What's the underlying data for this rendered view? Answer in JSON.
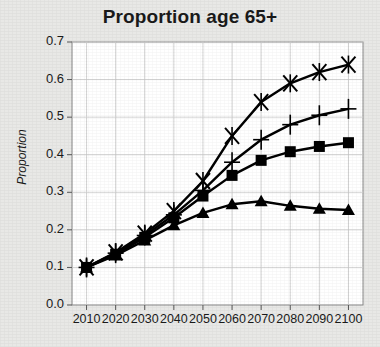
{
  "figure": {
    "background_color": "#e8e8e6",
    "plot_background_color": "#ffffff"
  },
  "chart_data": {
    "type": "line",
    "title": "Proportion age 65+",
    "xlabel": "",
    "ylabel": "Proportion",
    "x": [
      2010,
      2020,
      2030,
      2040,
      2050,
      2060,
      2070,
      2080,
      2090,
      2100
    ],
    "xtick_labels": [
      "2010",
      "2020",
      "2030",
      "2040",
      "2050",
      "2060",
      "2070",
      "2080",
      "2090",
      "2100"
    ],
    "ytick_labels": [
      "0.0",
      "0.1",
      "0.2",
      "0.3",
      "0.4",
      "0.5",
      "0.6",
      "0.7"
    ],
    "ytick_values": [
      0.0,
      0.1,
      0.2,
      0.3,
      0.4,
      0.5,
      0.6,
      0.7
    ],
    "xlim": [
      2005,
      2105
    ],
    "ylim": [
      0.0,
      0.7
    ],
    "grid": true,
    "legend_position": "none",
    "line_color": "#000000",
    "series": [
      {
        "name": "series-x",
        "marker": "x",
        "values": [
          0.1,
          0.14,
          0.19,
          0.25,
          0.33,
          0.45,
          0.54,
          0.59,
          0.62,
          0.64
        ]
      },
      {
        "name": "series-plus",
        "marker": "plus",
        "values": [
          0.1,
          0.138,
          0.185,
          0.24,
          0.305,
          0.38,
          0.44,
          0.48,
          0.505,
          0.522
        ]
      },
      {
        "name": "series-square",
        "marker": "square",
        "values": [
          0.1,
          0.135,
          0.18,
          0.232,
          0.29,
          0.345,
          0.385,
          0.408,
          0.422,
          0.432
        ]
      },
      {
        "name": "series-triangle",
        "marker": "triangle",
        "values": [
          0.1,
          0.132,
          0.172,
          0.212,
          0.245,
          0.268,
          0.276,
          0.264,
          0.256,
          0.253
        ]
      }
    ]
  }
}
